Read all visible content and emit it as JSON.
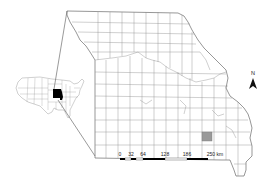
{
  "map": {
    "title": "",
    "region": "Missouri counties",
    "highlight_color": "#9a9a9a",
    "locator_fill": "#000000",
    "background": "#ffffff"
  },
  "north_arrow": {
    "label": "N"
  },
  "scale_bar": {
    "ticks": [
      "0",
      "32",
      "64",
      "128",
      "186",
      "250 km"
    ],
    "unit": "km"
  },
  "inset": {
    "label": "United States locator"
  }
}
